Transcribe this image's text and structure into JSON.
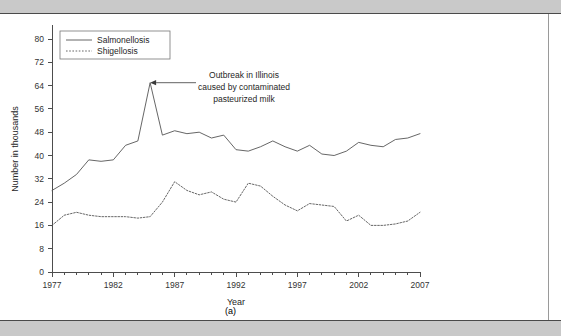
{
  "figure": {
    "caption": "(a)",
    "y_axis_title": "Number in thousands",
    "x_axis_title": "Year"
  },
  "annotation": {
    "line1": "Outbreak in Illinois",
    "line2": "caused by contaminated",
    "line3": "pasteurized milk"
  },
  "legend": {
    "items": [
      {
        "label": "Salmonellosis",
        "style": "solid"
      },
      {
        "label": "Shigellosis",
        "style": "dotted"
      }
    ]
  },
  "colors": {
    "line": "#555555",
    "axis": "#4d4d4d",
    "band": "#c9c9c9",
    "page": "#ffffff"
  },
  "chart_data": {
    "type": "line",
    "title": "",
    "subtitle": "",
    "xlabel": "Year",
    "ylabel": "Number in thousands",
    "xlim": [
      1977,
      2007
    ],
    "ylim": [
      0,
      80
    ],
    "yticks": [
      0,
      8,
      16,
      24,
      32,
      40,
      48,
      56,
      64,
      72,
      80
    ],
    "xticks": [
      1977,
      1982,
      1987,
      1992,
      1997,
      2002,
      2007
    ],
    "xtick_minor_step": 1,
    "grid": false,
    "legend_position": "top-left",
    "x": [
      1977,
      1978,
      1979,
      1980,
      1981,
      1982,
      1983,
      1984,
      1985,
      1986,
      1987,
      1988,
      1989,
      1990,
      1991,
      1992,
      1993,
      1994,
      1995,
      1996,
      1997,
      1998,
      1999,
      2000,
      2001,
      2002,
      2003,
      2004,
      2005,
      2006,
      2007
    ],
    "series": [
      {
        "name": "Salmonellosis",
        "style": "solid",
        "values": [
          28.0,
          30.5,
          33.5,
          38.5,
          38.0,
          38.5,
          43.5,
          45.0,
          65.0,
          47.0,
          48.5,
          47.5,
          48.0,
          46.0,
          47.0,
          42.0,
          41.5,
          43.0,
          45.0,
          43.0,
          41.5,
          43.5,
          40.5,
          40.0,
          41.5,
          44.5,
          43.5,
          43.0,
          45.5,
          46.0,
          47.5
        ]
      },
      {
        "name": "Shigellosis",
        "style": "dotted",
        "values": [
          16.0,
          19.5,
          20.5,
          19.5,
          19.0,
          19.0,
          19.0,
          18.5,
          19.0,
          24.0,
          31.0,
          28.0,
          26.5,
          27.5,
          25.0,
          24.0,
          30.5,
          29.5,
          26.0,
          23.0,
          21.0,
          23.5,
          23.0,
          22.5,
          17.5,
          19.5,
          16.0,
          16.0,
          16.5,
          17.5,
          20.5
        ]
      }
    ],
    "annotations": [
      {
        "text": "Outbreak in Illinois caused by contaminated pasteurized milk",
        "target_x": 1985,
        "target_y": 65,
        "series": "Salmonellosis"
      }
    ]
  }
}
